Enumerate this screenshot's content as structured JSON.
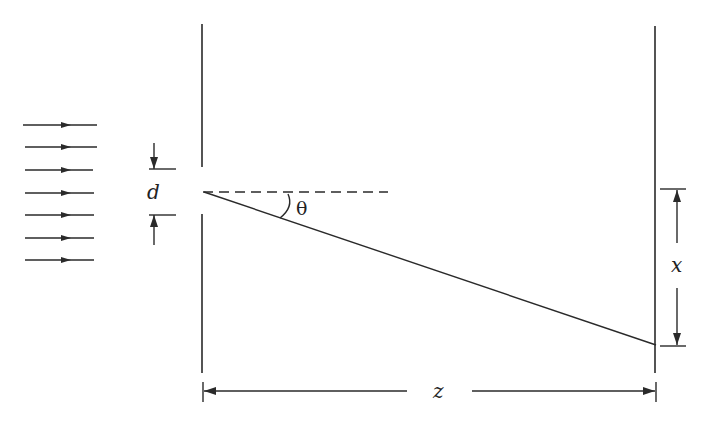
{
  "diagram": {
    "stroke_color": "#2a2a2a",
    "background": "#ffffff",
    "incident_wave": {
      "arrow_count": 7,
      "direction": "right"
    },
    "labels": {
      "slit_width": "d",
      "angle": "θ",
      "screen_offset": "x",
      "distance": "z"
    },
    "elements": [
      "incident plane-wave arrows",
      "barrier with slit of width d",
      "dashed optical axis",
      "diffracted ray at angle θ",
      "observation screen",
      "dimension arrow x on screen",
      "dimension arrow z between barrier and screen"
    ]
  }
}
